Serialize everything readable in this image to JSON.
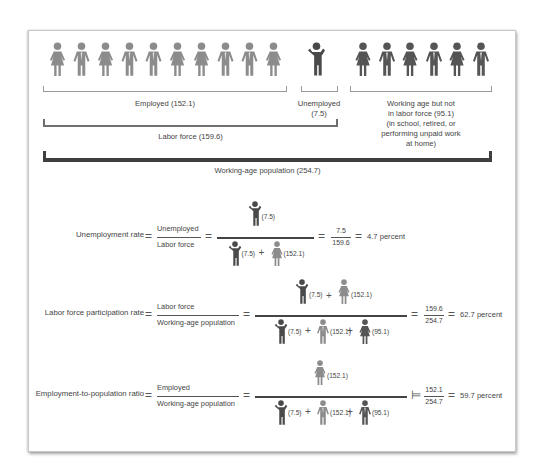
{
  "colors": {
    "employed": "#8c8c8c",
    "unemployed": "#4a4a4a",
    "not_in_labor_force": "#555555",
    "text": "#444444"
  },
  "top_diagram": {
    "employed_icons": [
      "woman",
      "man",
      "woman",
      "man",
      "man",
      "woman",
      "woman",
      "man",
      "man",
      "woman"
    ],
    "unemployed_icons": [
      "man-shrug"
    ],
    "not_in_labor_force_icons": [
      "woman",
      "man",
      "woman",
      "man",
      "woman",
      "man"
    ],
    "employed_label": "Employed (152.1)",
    "unemployed_label_line1": "Unemployed",
    "unemployed_label_line2": "(7.5)",
    "nilf_label_lines": [
      "Working age but not",
      "in labor force (95.1)",
      "(in school, retired, or",
      "performing unpaid work",
      "at home)"
    ],
    "labor_force_label": "Labor force (159.6)",
    "working_age_label": "Working-age population (254.7)"
  },
  "equations": [
    {
      "name": "Unemployment rate",
      "label": "Unemployment rate",
      "numerator": "Unemployed",
      "denominator": "Labor force",
      "icon_numerator": [
        {
          "icon": "unemployed",
          "value": "(7.5)"
        }
      ],
      "icon_denominator": [
        {
          "icon": "unemployed",
          "value": "(7.5)"
        },
        {
          "icon": "employed-woman",
          "value": "(152.1)"
        }
      ],
      "num_value": "7.5",
      "den_value": "159.6",
      "result": "4.7 percent"
    },
    {
      "name": "Labor force participation rate",
      "label": "Labor force participation rate",
      "numerator": "Labor force",
      "denominator": "Working-age population",
      "icon_numerator": [
        {
          "icon": "unemployed",
          "value": "(7.5)"
        },
        {
          "icon": "employed-woman",
          "value": "(152.1)"
        }
      ],
      "icon_denominator": [
        {
          "icon": "unemployed",
          "value": "(7.5)"
        },
        {
          "icon": "employed-man",
          "value": "(152.1)"
        },
        {
          "icon": "nilf-woman",
          "value": "(95.1)"
        }
      ],
      "num_value": "159.6",
      "den_value": "254.7",
      "result": "62.7 percent"
    },
    {
      "name": "Employment-to-population ratio",
      "label": "Employment-to-population ratio",
      "numerator": "Employed",
      "denominator": "Working-age population",
      "icon_numerator": [
        {
          "icon": "employed-woman",
          "value": "(152.1)"
        }
      ],
      "icon_denominator": [
        {
          "icon": "unemployed",
          "value": "(7.5)"
        },
        {
          "icon": "employed-man",
          "value": "(152.1)"
        },
        {
          "icon": "nilf-man",
          "value": "(95.1)"
        }
      ],
      "num_value": "152.1",
      "den_value": "254.7",
      "result": "59.7 percent"
    }
  ],
  "symbols": {
    "equals": "=",
    "plus": "+",
    "models": "⊨"
  }
}
